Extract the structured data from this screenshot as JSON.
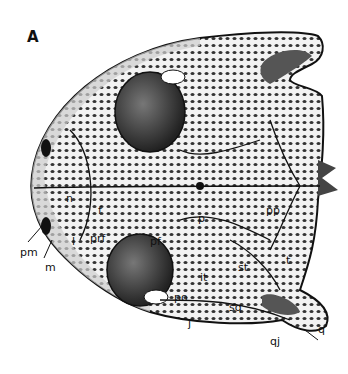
{
  "figure": {
    "panel_label": "A",
    "colors": {
      "ink": "#111111",
      "paper": "#ffffff",
      "bone": "#e8e8e8",
      "orbit": "#4a4a4a"
    }
  },
  "labels": {
    "n": "n",
    "f": "f",
    "pm": "pm",
    "m": "m",
    "l": "l",
    "prf": "prf",
    "pf": "pf",
    "p": "p",
    "pp": "pp",
    "t": "t",
    "st": "st",
    "it": "it",
    "po": "po",
    "j": "j",
    "sq": "sq",
    "qj": "qj",
    "q": "q"
  }
}
